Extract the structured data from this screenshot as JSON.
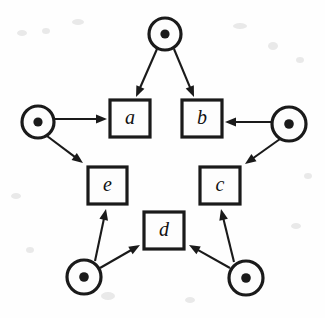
{
  "figure": {
    "kind": "petri-net",
    "title": "",
    "background_color": "#fefefe",
    "ink_color": "#1a1a1a",
    "width": 325,
    "height": 318
  },
  "places": [
    {
      "id": "p-top",
      "name": "place-top",
      "cx": 165,
      "cy": 34,
      "r": 16,
      "tokens": 1,
      "token_r": 4.6
    },
    {
      "id": "p-left",
      "name": "place-left",
      "cx": 38,
      "cy": 122,
      "r": 16,
      "tokens": 1,
      "token_r": 4.6
    },
    {
      "id": "p-right",
      "name": "place-right",
      "cx": 289,
      "cy": 124,
      "r": 17,
      "tokens": 1,
      "token_r": 4.8
    },
    {
      "id": "p-bottom-left",
      "name": "place-bottom-left",
      "cx": 84,
      "cy": 277,
      "r": 17,
      "tokens": 1,
      "token_r": 4.8
    },
    {
      "id": "p-bottom-right",
      "name": "place-bottom-right",
      "cx": 246,
      "cy": 278,
      "r": 17,
      "tokens": 1,
      "token_r": 4.8
    }
  ],
  "transitions": [
    {
      "id": "t-a",
      "name": "transition-a",
      "label": "a",
      "x": 110,
      "y": 100,
      "w": 40,
      "h": 37
    },
    {
      "id": "t-b",
      "name": "transition-b",
      "label": "b",
      "x": 182,
      "y": 100,
      "w": 40,
      "h": 37
    },
    {
      "id": "t-c",
      "name": "transition-c",
      "label": "c",
      "x": 200,
      "y": 167,
      "w": 40,
      "h": 37
    },
    {
      "id": "t-d",
      "name": "transition-d",
      "label": "d",
      "x": 144,
      "y": 212,
      "w": 40,
      "h": 37
    },
    {
      "id": "t-e",
      "name": "transition-e",
      "label": "e",
      "x": 88,
      "y": 167,
      "w": 39,
      "h": 37
    }
  ],
  "arcs": [
    {
      "id": "arc-top-a",
      "name": "arc-place-top-to-a",
      "from": "p-top",
      "to": "t-a",
      "x1": 157,
      "y1": 49,
      "x2": 136,
      "y2": 97
    },
    {
      "id": "arc-top-b",
      "name": "arc-place-top-to-b",
      "from": "p-top",
      "to": "t-b",
      "x1": 174,
      "y1": 49,
      "x2": 194,
      "y2": 97
    },
    {
      "id": "arc-left-a",
      "name": "arc-place-left-to-a",
      "from": "p-left",
      "to": "t-a",
      "x1": 55,
      "y1": 119,
      "x2": 107,
      "y2": 119
    },
    {
      "id": "arc-left-e",
      "name": "arc-place-left-to-e",
      "from": "p-left",
      "to": "t-e",
      "x1": 47,
      "y1": 136,
      "x2": 83,
      "y2": 163
    },
    {
      "id": "arc-right-b",
      "name": "arc-place-right-to-b",
      "from": "p-right",
      "to": "t-b",
      "x1": 271,
      "y1": 122,
      "x2": 225,
      "y2": 122
    },
    {
      "id": "arc-right-c",
      "name": "arc-place-right-to-c",
      "from": "p-right",
      "to": "t-c",
      "x1": 280,
      "y1": 139,
      "x2": 245,
      "y2": 164
    },
    {
      "id": "arc-bl-e",
      "name": "arc-place-bottom-left-to-e",
      "from": "p-bottom-left",
      "to": "t-e",
      "x1": 95,
      "y1": 261,
      "x2": 106,
      "y2": 209
    },
    {
      "id": "arc-bl-d",
      "name": "arc-place-bottom-left-to-d",
      "from": "p-bottom-left",
      "to": "t-d",
      "x1": 100,
      "y1": 268,
      "x2": 140,
      "y2": 245
    },
    {
      "id": "arc-br-c",
      "name": "arc-place-bottom-right-to-c",
      "from": "p-bottom-right",
      "to": "t-c",
      "x1": 234,
      "y1": 262,
      "x2": 221,
      "y2": 209
    },
    {
      "id": "arc-br-d",
      "name": "arc-place-bottom-right-to-d",
      "from": "p-bottom-right",
      "to": "t-d",
      "x1": 230,
      "y1": 268,
      "x2": 189,
      "y2": 245
    }
  ],
  "speckles": [
    {
      "cx": 22,
      "cy": 33,
      "rx": 5,
      "ry": 3
    },
    {
      "cx": 46,
      "cy": 31,
      "rx": 4,
      "ry": 3
    },
    {
      "cx": 78,
      "cy": 22,
      "rx": 6,
      "ry": 3
    },
    {
      "cx": 240,
      "cy": 26,
      "rx": 7,
      "ry": 3
    },
    {
      "cx": 273,
      "cy": 46,
      "rx": 5,
      "ry": 4
    },
    {
      "cx": 300,
      "cy": 60,
      "rx": 4,
      "ry": 3
    },
    {
      "cx": 16,
      "cy": 196,
      "rx": 5,
      "ry": 3
    },
    {
      "cx": 30,
      "cy": 250,
      "rx": 4,
      "ry": 3
    },
    {
      "cx": 108,
      "cy": 296,
      "rx": 7,
      "ry": 4
    },
    {
      "cx": 190,
      "cy": 300,
      "rx": 5,
      "ry": 3
    },
    {
      "cx": 296,
      "cy": 226,
      "rx": 5,
      "ry": 3
    },
    {
      "cx": 308,
      "cy": 176,
      "rx": 4,
      "ry": 3
    }
  ]
}
